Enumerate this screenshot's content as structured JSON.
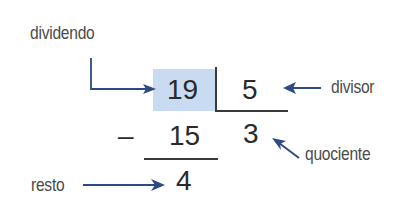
{
  "labels": {
    "dividend": "dividendo",
    "divisor": "divisor",
    "quotient": "quociente",
    "remainder": "resto"
  },
  "values": {
    "dividend": "19",
    "divisor": "5",
    "minus_sign": "–",
    "product": "15",
    "quotient": "3",
    "remainder": "4"
  },
  "colors": {
    "highlight": "#c9dbf0",
    "arrow": "#2b4a86",
    "text": "#333333"
  }
}
